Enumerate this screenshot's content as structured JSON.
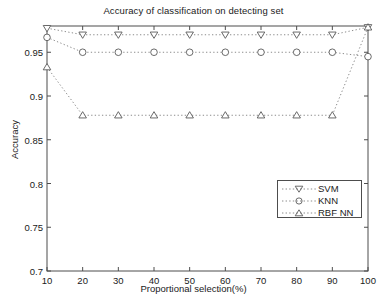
{
  "chart_data": {
    "type": "line",
    "title": "Accuracy of classification on detecting set",
    "xlabel": "Proportional selection(%)",
    "ylabel": "Accuracy",
    "x": [
      10,
      20,
      30,
      40,
      50,
      60,
      70,
      80,
      90,
      100
    ],
    "xlim": [
      10,
      100
    ],
    "ylim": [
      0.7,
      0.98
    ],
    "xticks": [
      "10",
      "20",
      "30",
      "40",
      "50",
      "60",
      "70",
      "80",
      "90",
      "100"
    ],
    "yticks": [
      "0.7",
      "0.75",
      "0.8",
      "0.85",
      "0.9",
      "0.95"
    ],
    "ytick_values": [
      0.7,
      0.75,
      0.8,
      0.85,
      0.9,
      0.95
    ],
    "grid": false,
    "legend_position": "lower right",
    "line_style": "dotted",
    "series": [
      {
        "name": "SVM",
        "marker": "triangle-down",
        "color": "#5a5a5a",
        "values": [
          0.9775,
          0.97,
          0.97,
          0.97,
          0.97,
          0.97,
          0.97,
          0.97,
          0.97,
          0.9785
        ]
      },
      {
        "name": "KNN",
        "marker": "circle",
        "color": "#5a5a5a",
        "values": [
          0.967,
          0.95,
          0.95,
          0.95,
          0.95,
          0.95,
          0.95,
          0.95,
          0.95,
          0.945
        ]
      },
      {
        "name": "RBF NN",
        "marker": "triangle-up",
        "color": "#5a5a5a",
        "values": [
          0.933,
          0.878,
          0.878,
          0.878,
          0.878,
          0.878,
          0.878,
          0.878,
          0.878,
          0.9785
        ]
      }
    ]
  },
  "legend": {
    "items": [
      {
        "label": "SVM",
        "marker": "triangle-down"
      },
      {
        "label": "KNN",
        "marker": "circle"
      },
      {
        "label": "RBF NN",
        "marker": "triangle-up"
      }
    ]
  }
}
